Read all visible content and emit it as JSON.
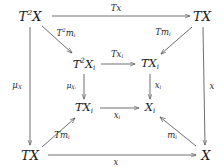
{
  "diagram": {
    "type": "commutative-diagram",
    "nodes": [
      {
        "id": "t2x",
        "label_html": "T<sup>2</sup>X",
        "label_text": "T^2 X",
        "x": 30,
        "y": 16
      },
      {
        "id": "tx_tr",
        "label_html": "TX",
        "label_text": "TX",
        "x": 202,
        "y": 16
      },
      {
        "id": "t2xi",
        "label_html": "T<sup>2</sup>X<sub>i</sub>",
        "label_text": "T^2 X_i",
        "x": 84,
        "y": 64
      },
      {
        "id": "txi_tr",
        "label_html": "TX<sub>i</sub>",
        "label_text": "TX_i",
        "x": 150,
        "y": 64
      },
      {
        "id": "txi_bl",
        "label_html": "TX<sub>i</sub>",
        "label_text": "TX_i",
        "x": 84,
        "y": 108
      },
      {
        "id": "xi_br",
        "label_html": "X<sub>i</sub>",
        "label_text": "X_i",
        "x": 150,
        "y": 108
      },
      {
        "id": "tx_bl",
        "label_html": "TX",
        "label_text": "TX",
        "x": 30,
        "y": 155
      },
      {
        "id": "x_br",
        "label_html": "X",
        "label_text": "X",
        "x": 206,
        "y": 155
      }
    ],
    "edges": [
      {
        "id": "top",
        "from": "t2x",
        "to": "tx_tr",
        "label_html": "T<span class=\"upright\"></span><i>x</i>",
        "label_text": "Tx",
        "label_x": 116,
        "label_y": 8,
        "kind": "horizontal"
      },
      {
        "id": "diag-top-left",
        "from": "t2x",
        "to": "t2xi",
        "label_html": "T<sup>2</sup>m<sub>i</sub>",
        "label_text": "T^2 m_i",
        "label_x": 66,
        "label_y": 33,
        "kind": "diagonal"
      },
      {
        "id": "diag-top-right",
        "from": "tx_tr",
        "to": "txi_tr",
        "label_html": "Tm<sub>i</sub>",
        "label_text": "Tm_i",
        "label_x": 163,
        "label_y": 33,
        "kind": "diagonal"
      },
      {
        "id": "inner-top",
        "from": "t2xi",
        "to": "txi_tr",
        "label_html": "Tx<sub>i</sub>",
        "label_text": "Tx_i",
        "label_x": 117,
        "label_y": 55,
        "kind": "horizontal"
      },
      {
        "id": "left-outer",
        "from": "t2x",
        "to": "tx_bl",
        "label_html": "&mu;<sub>X</sub>",
        "label_text": "mu_X",
        "label_x": 17,
        "label_y": 86,
        "kind": "vertical"
      },
      {
        "id": "right-outer",
        "from": "tx_tr",
        "to": "x_br",
        "label_html": "x",
        "label_text": "x",
        "label_x": 212,
        "label_y": 86,
        "kind": "vertical"
      },
      {
        "id": "inner-left",
        "from": "t2xi",
        "to": "txi_bl",
        "label_html": "&mu;<sub>X<sub>i</sub></sub>",
        "label_text": "mu_{X_i}",
        "label_x": 71,
        "label_y": 86,
        "kind": "vertical"
      },
      {
        "id": "inner-right",
        "from": "txi_tr",
        "to": "xi_br",
        "label_html": "x<sub>i</sub>",
        "label_text": "x_i",
        "label_x": 158,
        "label_y": 86,
        "kind": "vertical"
      },
      {
        "id": "inner-bottom",
        "from": "txi_bl",
        "to": "xi_br",
        "label_html": "x<sub>i</sub>",
        "label_text": "x_i",
        "label_x": 117,
        "label_y": 116,
        "kind": "horizontal"
      },
      {
        "id": "diag-bottom-left",
        "from": "tx_bl",
        "to": "txi_bl",
        "label_html": "Tm<sub>i</sub>",
        "label_text": "Tm_i",
        "label_x": 62,
        "label_y": 136,
        "kind": "diagonal"
      },
      {
        "id": "diag-bottom-right",
        "from": "x_br",
        "to": "xi_br",
        "label_html": "m<sub>i</sub>",
        "label_text": "m_i",
        "label_x": 172,
        "label_y": 136,
        "kind": "diagonal"
      },
      {
        "id": "bottom",
        "from": "tx_bl",
        "to": "x_br",
        "label_html": "x",
        "label_text": "x",
        "label_x": 116,
        "label_y": 162,
        "kind": "horizontal"
      }
    ],
    "style": {
      "ink": "#1a1a1a",
      "line": "#555555",
      "background": "#ffffff"
    }
  }
}
